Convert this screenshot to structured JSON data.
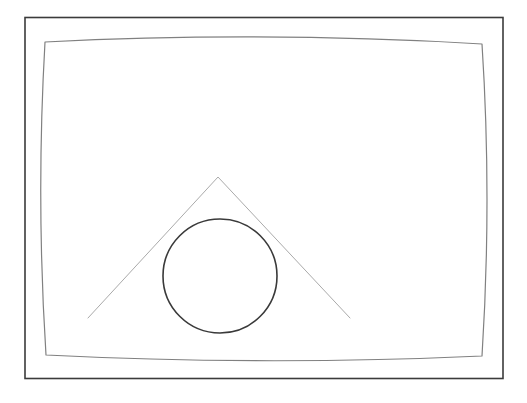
{
  "document": {
    "title": "Distorted Frame with Triangle and Circle",
    "background_color": "#ffffff",
    "width": 527,
    "height": 403
  },
  "caption": {
    "text": ""
  },
  "figure": {
    "name": "pincushion-distortion-diagram",
    "stroke_colors": {
      "outer_border": "#3b3b3b",
      "inner_frame": "#808080",
      "triangle": "#aaaaaa",
      "circle": "#3a3a3a"
    },
    "stroke_widths": {
      "outer_border": 1.6,
      "inner_frame": 1.2,
      "triangle": 1.0,
      "circle": 1.6
    },
    "fill": "none"
  },
  "shapes": {
    "outer_border": {
      "label": "Outer rectangle border",
      "type": "rect",
      "x": 25,
      "y": 17.5,
      "width": 478,
      "height": 361
    },
    "inner_frame": {
      "label": "Pincushion distorted frame",
      "type": "closed-curve",
      "corners": {
        "top_left": [
          45,
          42
        ],
        "top_right": [
          482,
          44
        ],
        "bottom_right": [
          482,
          356
        ],
        "bottom_left": [
          46,
          355
        ]
      },
      "edge_bow": {
        "top_mid": [
          264,
          31
        ],
        "right_mid": [
          492,
          199
        ],
        "bottom_mid": [
          264,
          366
        ],
        "left_mid": [
          36,
          199
        ]
      }
    },
    "triangle": {
      "label": "Isosceles triangle outline",
      "type": "polyline",
      "apex": [
        218,
        177
      ],
      "base_left": [
        88,
        318
      ],
      "base_right": [
        350,
        318
      ],
      "closed": false
    },
    "circle": {
      "label": "Circle outline",
      "type": "circle",
      "center_x": 220,
      "center_y": 276,
      "radius": 57
    }
  }
}
